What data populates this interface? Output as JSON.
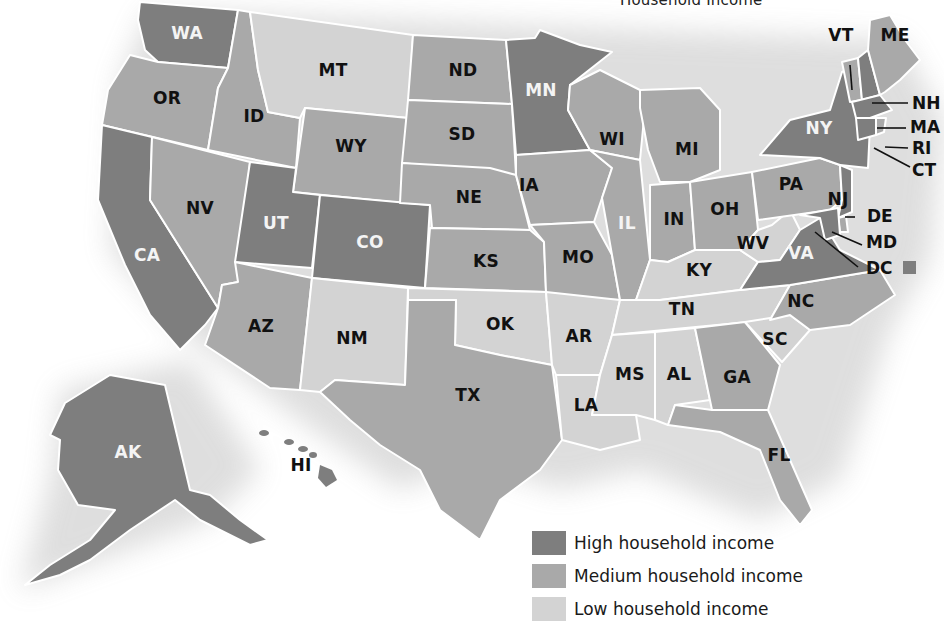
{
  "title": "Household Income",
  "colors": {
    "high": "#7e7e7e",
    "medium": "#a9a9a9",
    "low": "#d3d3d3",
    "border": "#ffffff",
    "label_on_high": "#f4f4f4",
    "label_on_other": "#111111"
  },
  "legend": {
    "items": [
      {
        "key": "high",
        "label": "High household income",
        "color": "#7e7e7e"
      },
      {
        "key": "medium",
        "label": "Medium household income",
        "color": "#a9a9a9"
      },
      {
        "key": "low",
        "label": "Low household income",
        "color": "#d3d3d3"
      }
    ]
  },
  "states": {
    "WA": {
      "label": "WA",
      "category": "high"
    },
    "OR": {
      "label": "OR",
      "category": "medium"
    },
    "CA": {
      "label": "CA",
      "category": "high"
    },
    "ID": {
      "label": "ID",
      "category": "medium"
    },
    "NV": {
      "label": "NV",
      "category": "medium"
    },
    "MT": {
      "label": "MT",
      "category": "low"
    },
    "WY": {
      "label": "WY",
      "category": "medium"
    },
    "UT": {
      "label": "UT",
      "category": "high"
    },
    "CO": {
      "label": "CO",
      "category": "high"
    },
    "AZ": {
      "label": "AZ",
      "category": "medium"
    },
    "NM": {
      "label": "NM",
      "category": "low"
    },
    "ND": {
      "label": "ND",
      "category": "medium"
    },
    "SD": {
      "label": "SD",
      "category": "medium"
    },
    "NE": {
      "label": "NE",
      "category": "medium"
    },
    "KS": {
      "label": "KS",
      "category": "medium"
    },
    "OK": {
      "label": "OK",
      "category": "low"
    },
    "TX": {
      "label": "TX",
      "category": "medium"
    },
    "MN": {
      "label": "MN",
      "category": "high"
    },
    "IA": {
      "label": "IA",
      "category": "medium"
    },
    "MO": {
      "label": "MO",
      "category": "medium"
    },
    "AR": {
      "label": "AR",
      "category": "low"
    },
    "LA": {
      "label": "LA",
      "category": "low"
    },
    "WI": {
      "label": "WI",
      "category": "medium"
    },
    "IL": {
      "label": "IL",
      "category": "medium"
    },
    "MI": {
      "label": "MI",
      "category": "medium"
    },
    "IN": {
      "label": "IN",
      "category": "medium"
    },
    "OH": {
      "label": "OH",
      "category": "medium"
    },
    "KY": {
      "label": "KY",
      "category": "low"
    },
    "TN": {
      "label": "TN",
      "category": "low"
    },
    "MS": {
      "label": "MS",
      "category": "low"
    },
    "AL": {
      "label": "AL",
      "category": "low"
    },
    "GA": {
      "label": "GA",
      "category": "medium"
    },
    "FL": {
      "label": "FL",
      "category": "medium"
    },
    "SC": {
      "label": "SC",
      "category": "low"
    },
    "NC": {
      "label": "NC",
      "category": "medium"
    },
    "VA": {
      "label": "VA",
      "category": "high"
    },
    "WV": {
      "label": "WV",
      "category": "low"
    },
    "PA": {
      "label": "PA",
      "category": "medium"
    },
    "NY": {
      "label": "NY",
      "category": "high"
    },
    "NJ": {
      "label": "NJ",
      "category": "high"
    },
    "DE": {
      "label": "DE",
      "category": "medium"
    },
    "MD": {
      "label": "MD",
      "category": "high"
    },
    "DC": {
      "label": "DC",
      "category": "high"
    },
    "CT": {
      "label": "CT",
      "category": "high"
    },
    "RI": {
      "label": "RI",
      "category": "medium"
    },
    "MA": {
      "label": "MA",
      "category": "high"
    },
    "VT": {
      "label": "VT",
      "category": "medium"
    },
    "NH": {
      "label": "NH",
      "category": "high"
    },
    "ME": {
      "label": "ME",
      "category": "medium"
    },
    "AK": {
      "label": "AK",
      "category": "high"
    },
    "HI": {
      "label": "HI",
      "category": "high"
    }
  }
}
